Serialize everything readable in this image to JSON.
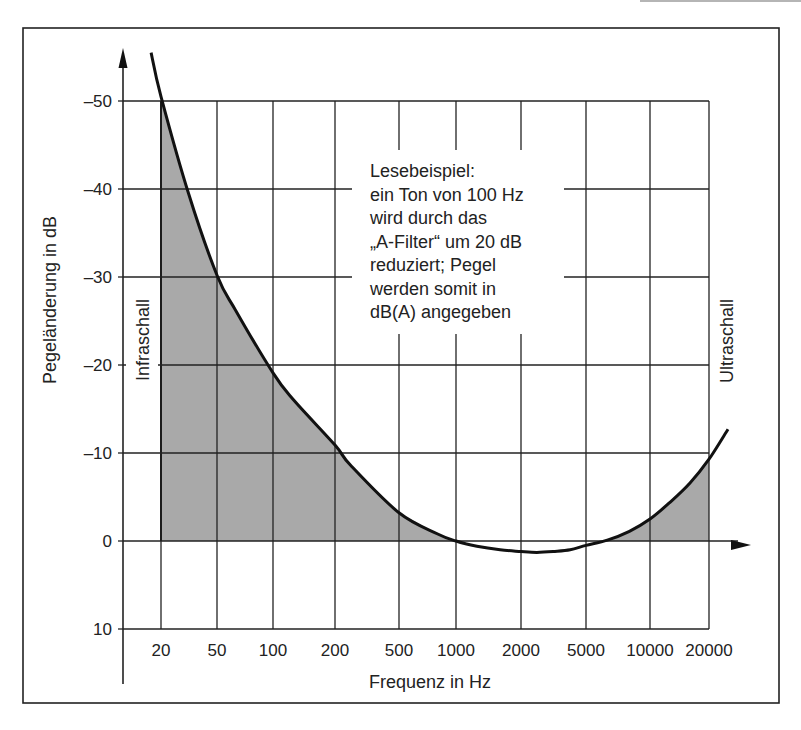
{
  "chart_data": {
    "type": "area",
    "title": "",
    "xlabel": "Frequenz in Hz",
    "ylabel": "Pegeländerung in dB",
    "x_scale": "log",
    "x_ticks": [
      20,
      50,
      100,
      200,
      500,
      1000,
      2000,
      5000,
      10000,
      20000
    ],
    "x_tick_labels": [
      "20",
      "50",
      "100",
      "200",
      "500",
      "1000",
      "2000",
      "5000",
      "10000",
      "20000"
    ],
    "y_ticks": [
      -50,
      -40,
      -30,
      -20,
      -10,
      0,
      10
    ],
    "y_tick_labels": [
      "–50",
      "–40",
      "–30",
      "–20",
      "–10",
      "0",
      "10"
    ],
    "y_direction": "inverted",
    "ylim": [
      -50,
      10
    ],
    "xlim": [
      20,
      20000
    ],
    "grid": true,
    "series": [
      {
        "name": "A-Filter",
        "x": [
          17,
          20,
          31.5,
          50,
          63,
          100,
          125,
          200,
          250,
          500,
          800,
          1000,
          1250,
          1600,
          2000,
          2500,
          3150,
          4000,
          5000,
          6300,
          8000,
          10000,
          12500,
          16000,
          20000,
          25000
        ],
        "values": [
          -55.5,
          -50.5,
          -39.4,
          -30.2,
          -26.2,
          -19.1,
          -16.1,
          -10.9,
          -8.6,
          -3.2,
          -0.8,
          0.0,
          0.6,
          1.0,
          1.2,
          1.3,
          1.2,
          1.0,
          0.5,
          -0.1,
          -1.1,
          -2.5,
          -4.3,
          -6.6,
          -9.3,
          -12.7
        ],
        "shaded": "area between curve and 0 dB where attenuation occurs, from 20 Hz to 20000 Hz"
      }
    ],
    "annotations": {
      "left_band": "Infraschall",
      "right_band": "Ultraschall",
      "note_lines": [
        "Lesebeispiel:",
        "ein Ton von 100 Hz",
        "wird durch das",
        "„A-Filter“ um 20 dB",
        "reduziert; Pegel",
        "werden somit in",
        "dB(A) angegeben"
      ]
    },
    "colors": {
      "fill": "#a9a9a9",
      "line": "#111111",
      "grid": "#222222"
    }
  }
}
